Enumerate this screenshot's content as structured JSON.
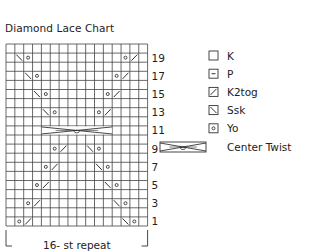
{
  "title": "Diamond Lace Chart",
  "chart_data": {
    "type": "knitting-chart",
    "title": "Diamond Lace Chart",
    "columns": 16,
    "rows": 20,
    "row_labels": [
      "19",
      "17",
      "15",
      "13",
      "11",
      "9",
      "7",
      "5",
      "3",
      "1"
    ],
    "repeat_label": "16- st repeat",
    "symbols": [
      {
        "row": 19,
        "col": 2,
        "type": "ssk"
      },
      {
        "row": 19,
        "col": 3,
        "type": "yo"
      },
      {
        "row": 19,
        "col": 14,
        "type": "yo"
      },
      {
        "row": 19,
        "col": 15,
        "type": "k2tog"
      },
      {
        "row": 17,
        "col": 3,
        "type": "ssk"
      },
      {
        "row": 17,
        "col": 4,
        "type": "yo"
      },
      {
        "row": 17,
        "col": 13,
        "type": "yo"
      },
      {
        "row": 17,
        "col": 14,
        "type": "k2tog"
      },
      {
        "row": 15,
        "col": 4,
        "type": "ssk"
      },
      {
        "row": 15,
        "col": 5,
        "type": "yo"
      },
      {
        "row": 15,
        "col": 12,
        "type": "yo"
      },
      {
        "row": 15,
        "col": 13,
        "type": "k2tog"
      },
      {
        "row": 13,
        "col": 5,
        "type": "ssk"
      },
      {
        "row": 13,
        "col": 6,
        "type": "yo"
      },
      {
        "row": 13,
        "col": 11,
        "type": "yo"
      },
      {
        "row": 13,
        "col": 12,
        "type": "k2tog"
      },
      {
        "row": 11,
        "col": 5,
        "type": "center-twist",
        "span": 8
      },
      {
        "row": 9,
        "col": 6,
        "type": "yo"
      },
      {
        "row": 9,
        "col": 7,
        "type": "k2tog"
      },
      {
        "row": 9,
        "col": 10,
        "type": "ssk"
      },
      {
        "row": 9,
        "col": 11,
        "type": "yo"
      },
      {
        "row": 7,
        "col": 5,
        "type": "yo"
      },
      {
        "row": 7,
        "col": 6,
        "type": "k2tog"
      },
      {
        "row": 7,
        "col": 11,
        "type": "ssk"
      },
      {
        "row": 7,
        "col": 12,
        "type": "yo"
      },
      {
        "row": 5,
        "col": 4,
        "type": "yo"
      },
      {
        "row": 5,
        "col": 5,
        "type": "k2tog"
      },
      {
        "row": 5,
        "col": 12,
        "type": "ssk"
      },
      {
        "row": 5,
        "col": 13,
        "type": "yo"
      },
      {
        "row": 3,
        "col": 3,
        "type": "yo"
      },
      {
        "row": 3,
        "col": 4,
        "type": "k2tog"
      },
      {
        "row": 3,
        "col": 13,
        "type": "ssk"
      },
      {
        "row": 3,
        "col": 14,
        "type": "yo"
      },
      {
        "row": 1,
        "col": 2,
        "type": "yo"
      },
      {
        "row": 1,
        "col": 3,
        "type": "k2tog"
      },
      {
        "row": 1,
        "col": 14,
        "type": "ssk"
      },
      {
        "row": 1,
        "col": 15,
        "type": "yo"
      }
    ]
  },
  "legend": [
    {
      "symbol": "k",
      "label": "K"
    },
    {
      "symbol": "p",
      "label": "P"
    },
    {
      "symbol": "k2tog",
      "label": "K2tog"
    },
    {
      "symbol": "ssk",
      "label": "Ssk"
    },
    {
      "symbol": "yo",
      "label": "Yo"
    },
    {
      "symbol": "center-twist",
      "label": "Center Twist"
    }
  ],
  "colors": {
    "line": "#333333",
    "grid": "#444444",
    "background": "#ffffff"
  }
}
